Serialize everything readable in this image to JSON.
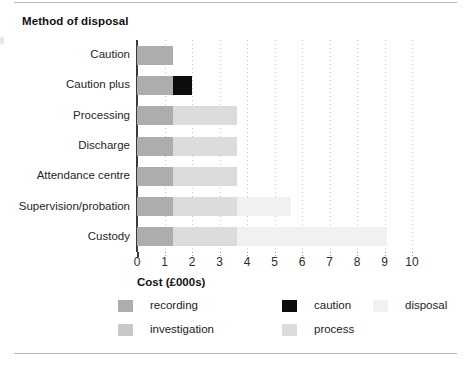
{
  "figure": {
    "title": "Method of disposal",
    "background": "#ffffff"
  },
  "chart_data": {
    "type": "bar",
    "orientation": "horizontal",
    "stacked": true,
    "title": "Method of disposal",
    "xlabel": "Cost (£000s)",
    "ylabel": "",
    "xlim": [
      0,
      10
    ],
    "xticks": [
      0,
      1,
      2,
      3,
      4,
      5,
      6,
      7,
      8,
      9,
      10
    ],
    "xticklabels": [
      "0",
      "1",
      "2",
      "3",
      "4",
      "5",
      "6",
      "7",
      "8",
      "9",
      "10"
    ],
    "grid": "vertical-dotted",
    "legend_position": "below-axes",
    "categories": [
      "Caution",
      "Caution plus",
      "Processing",
      "Discharge",
      "Attendance centre",
      "Supervision/probation",
      "Custody"
    ],
    "series": [
      {
        "name": "recording",
        "color": "#adadad",
        "values": [
          1.3,
          1.3,
          1.3,
          1.3,
          1.3,
          1.3,
          1.3
        ]
      },
      {
        "name": "investigation",
        "color": "#c8c8c8",
        "values": [
          0.0,
          0.0,
          0.0,
          0.0,
          0.0,
          0.0,
          0.0
        ]
      },
      {
        "name": "caution",
        "color": "#0d0d0d",
        "values": [
          0.0,
          0.7,
          0.0,
          0.0,
          0.0,
          0.0,
          0.0
        ]
      },
      {
        "name": "process",
        "color": "#dcdcdc",
        "values": [
          0.0,
          0.0,
          2.35,
          2.35,
          2.35,
          2.35,
          2.35
        ]
      },
      {
        "name": "disposal",
        "color": "#f1f1f1",
        "values": [
          0.0,
          0.0,
          0.0,
          0.0,
          0.0,
          1.95,
          5.45
        ]
      }
    ],
    "totals": [
      1.3,
      2.0,
      3.65,
      3.65,
      3.65,
      5.6,
      9.1
    ]
  },
  "legend": {
    "items": [
      {
        "label": "recording",
        "color": "#adadad",
        "col": 0,
        "row": 0
      },
      {
        "label": "investigation",
        "color": "#c8c8c8",
        "col": 0,
        "row": 1
      },
      {
        "label": "caution",
        "color": "#0d0d0d",
        "col": 1,
        "row": 0
      },
      {
        "label": "process",
        "color": "#dcdcdc",
        "col": 1,
        "row": 1
      },
      {
        "label": "disposal",
        "color": "#f1f1f1",
        "col": 2,
        "row": 0
      }
    ]
  }
}
